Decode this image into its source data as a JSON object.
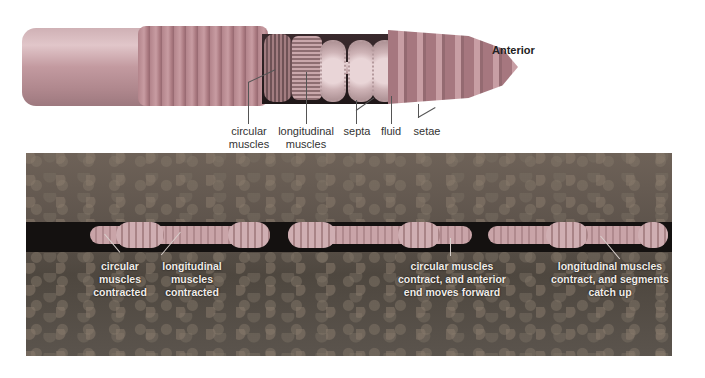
{
  "figure": {
    "top_panel": {
      "orientation_label": "Anterior",
      "labels": [
        {
          "line1": "circular",
          "line2": "muscles"
        },
        {
          "line1": "longitudinal",
          "line2": "muscles"
        },
        {
          "line1": "septa",
          "line2": ""
        },
        {
          "line1": "fluid",
          "line2": ""
        },
        {
          "line1": "setae",
          "line2": ""
        }
      ]
    },
    "bottom_panel": {
      "labels": [
        {
          "line1": "circular",
          "line2": "muscles",
          "line3": "contracted"
        },
        {
          "line1": "longitudinal",
          "line2": "muscles",
          "line3": "contracted"
        },
        {
          "line1": "circular muscles",
          "line2": "contract, and anterior",
          "line3": "end moves forward"
        },
        {
          "line1": "longitudinal muscles",
          "line2": "contract, and segments",
          "line3": "catch up"
        }
      ]
    },
    "colors": {
      "worm": "#b8888f",
      "soil": "#5e544c",
      "tunnel": "#141110",
      "label_dark": "#333333",
      "label_light": "#f0ece8"
    }
  }
}
